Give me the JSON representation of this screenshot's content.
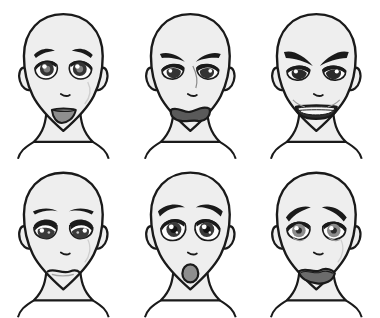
{
  "sheet": {
    "title": "Anime Facial Expression Reference Sheet",
    "description": "Six bald stylized anime head drawings arranged in a 2 by 3 grid, each showing a different facial expression.",
    "background_color": "#ffffff",
    "columns": 3,
    "rows": 2,
    "style": "black ink line art with flat grey tone shading"
  },
  "palette": {
    "outline": "#1a1a1a",
    "skin_fill": "#eeeeee",
    "skin_shadow": "#dcdcdc",
    "eye_dark": "#333333",
    "eye_iris": "#9a9a9a",
    "eye_white": "#fdfdfd",
    "mouth_inner": "#8e8e8e",
    "mouth_dark": "#5a5a5a",
    "teeth": "#f7f7f7",
    "background": "#ffffff"
  },
  "faces": [
    {
      "index": 1,
      "position": "top-left",
      "expression": "happy",
      "label": "Happy / Smiling",
      "brows": "gently arched, relaxed",
      "eyes": "open, large round irises with highlight",
      "mouth": "open smile, upward curve, grey inner mouth",
      "mood_color": "#9a9a9a"
    },
    {
      "index": 2,
      "position": "top-center",
      "expression": "upset",
      "label": "Upset / Grimacing",
      "brows": "inner ends lowered, slanted down toward nose",
      "eyes": "narrowed, half lidded",
      "mouth": "wide wavy open grimace, dark interior",
      "mood_color": "#5a5a5a"
    },
    {
      "index": 3,
      "position": "top-right",
      "expression": "angry",
      "label": "Angry / Gritted Teeth",
      "brows": "sharply angled down and inward, thick",
      "eyes": "narrowed, fierce",
      "mouth": "wide bared teeth, clenched jaw",
      "mood_color": "#2e2e2e"
    },
    {
      "index": 4,
      "position": "bottom-left",
      "expression": "sad",
      "label": "Sad / Downcast",
      "brows": "flat, slightly raised outer ends",
      "eyes": "heavy upper lids, drooping",
      "mouth": "small closed frown, slight downward curve",
      "mood_color": "#7d7d7d"
    },
    {
      "index": 5,
      "position": "bottom-center",
      "expression": "surprised",
      "label": "Surprised / Shocked",
      "brows": "raised high, arched",
      "eyes": "wide open, round pupils",
      "mouth": "small round open O shape",
      "mood_color": "#8e8e8e"
    },
    {
      "index": 6,
      "position": "bottom-right",
      "expression": "worried",
      "label": "Worried / Distressed",
      "brows": "inner ends raised, outer ends sloping down",
      "eyes": "large, glossy, slightly downturned",
      "mouth": "open wavering frown, dark interior",
      "mood_color": "#6b6b6b"
    }
  ]
}
